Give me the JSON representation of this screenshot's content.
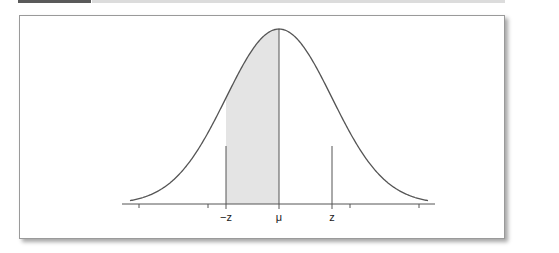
{
  "figure": {
    "type": "normal-distribution-diagram",
    "labels": {
      "neg_z": "−z",
      "mu": "μ",
      "z": "z"
    },
    "shaded_region": "between −z and μ",
    "colors": {
      "curve": "#555555",
      "shade": "#e4e4e4",
      "axis": "#555555",
      "topbar_dark": "#5a5a5a",
      "topbar_light": "#dcdcdc"
    }
  }
}
